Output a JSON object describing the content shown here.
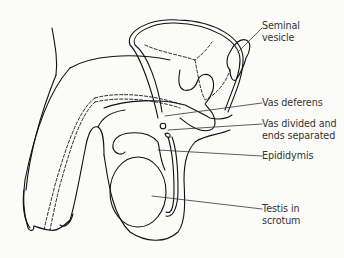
{
  "diagram": {
    "type": "anatomical line drawing",
    "labels": [
      {
        "id": "seminal-vesicle",
        "text": "Seminal\nvesicle",
        "x": 262,
        "y": 20
      },
      {
        "id": "vas-deferens",
        "text": "Vas deferens",
        "x": 262,
        "y": 97
      },
      {
        "id": "vas-divided",
        "text": "Vas divided and\nends separated",
        "x": 262,
        "y": 118
      },
      {
        "id": "epididymis",
        "text": "Epididymis",
        "x": 262,
        "y": 150
      },
      {
        "id": "testis",
        "text": "Testis in\nscrotum",
        "x": 262,
        "y": 203
      }
    ],
    "colors": {
      "line": "#111111",
      "text": "#333333",
      "background": "#fbfbfa"
    }
  }
}
